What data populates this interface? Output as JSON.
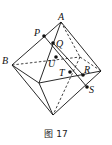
{
  "figure": {
    "caption": "图 17",
    "labels": {
      "A": "A",
      "B": "B",
      "P": "P",
      "Q": "Q",
      "U": "U",
      "T": "T",
      "R": "R",
      "S": "S"
    },
    "line_color": "#111111"
  }
}
